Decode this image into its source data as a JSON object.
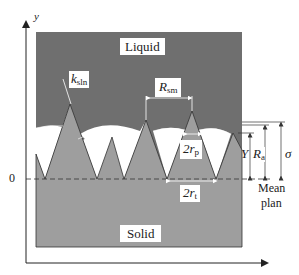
{
  "figure": {
    "axis": {
      "y_label": "y",
      "origin_label": "0"
    },
    "regions": {
      "liquid_label": "Liquid",
      "solid_label": "Solid"
    },
    "annotations": {
      "k_sln": {
        "main": "k",
        "sub": "sln"
      },
      "R_sm": {
        "main": "R",
        "sub": "sm"
      },
      "two_r_p": {
        "main": "2r",
        "sub": "p"
      },
      "two_r_t": {
        "main": "2r",
        "sub": "t"
      },
      "Y": "Y",
      "R_a": {
        "main": "R",
        "sub": "a"
      },
      "sigma": "σ",
      "mean_plane": [
        "Mean",
        "plan"
      ]
    },
    "colors": {
      "liquid": "#6f6f6f",
      "solid": "#9e9e9e",
      "bubble": "#ffffff",
      "axis": "#222222"
    }
  }
}
